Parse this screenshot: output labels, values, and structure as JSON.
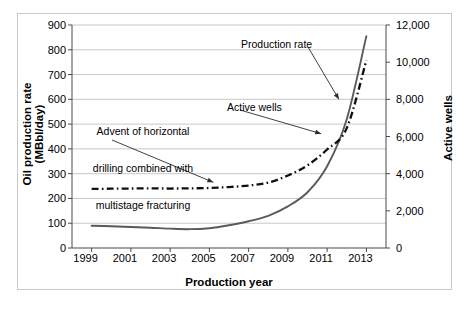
{
  "chart_data": {
    "type": "line",
    "title": "",
    "xlabel": "Production year",
    "ylabel": "Oil production rate (MBbl/day)",
    "y2label": "Active wells",
    "xlim": [
      1998,
      2014
    ],
    "ylim": [
      0,
      900
    ],
    "y2lim": [
      0,
      12000
    ],
    "grid": true,
    "legend_position": "inline-annotations",
    "xticks": [
      "1999",
      "2001",
      "2003",
      "2005",
      "2007",
      "2009",
      "2011",
      "2013"
    ],
    "xtick_values": [
      1999,
      2001,
      2003,
      2005,
      2007,
      2009,
      2011,
      2013
    ],
    "yticks": [
      "0",
      "100",
      "200",
      "300",
      "400",
      "500",
      "600",
      "700",
      "800",
      "900"
    ],
    "ytick_values": [
      0,
      100,
      200,
      300,
      400,
      500,
      600,
      700,
      800,
      900
    ],
    "y2ticks": [
      "0",
      "2,000",
      "4,000",
      "6,000",
      "8,000",
      "10,000",
      "12,000"
    ],
    "y2tick_values": [
      0,
      2000,
      4000,
      6000,
      8000,
      10000,
      12000
    ],
    "x": [
      1999,
      2000,
      2001,
      2002,
      2003,
      2004,
      2005,
      2006,
      2007,
      2008,
      2009,
      2010,
      2011,
      2012,
      2013
    ],
    "series": [
      {
        "name": "Production rate",
        "axis": "left",
        "units": "MBbl/day",
        "style": "solid",
        "color": "#5a5a5a",
        "values": [
          90,
          88,
          85,
          82,
          78,
          76,
          80,
          92,
          108,
          130,
          168,
          225,
          330,
          520,
          855
        ]
      },
      {
        "name": "Active wells",
        "axis": "right",
        "units": "wells",
        "style": "dash-dot",
        "color": "#101010",
        "values": [
          3180,
          3190,
          3200,
          3210,
          3200,
          3210,
          3230,
          3280,
          3360,
          3520,
          3900,
          4450,
          5300,
          6450,
          10100
        ]
      }
    ],
    "annotations": [
      {
        "name": "advent-annotation",
        "text": "Advent of horizontal\ndrilling combined with\nmultistage fracturing",
        "line1": "Advent of horizontal",
        "line2": "drilling combined with",
        "line3": "multistage fracturing",
        "points_to_x": 2005.2,
        "points_to_y_left": 253
      },
      {
        "name": "production-rate-label",
        "text": "Production rate",
        "points_to_x": 2011.6,
        "points_to_y_left": 600
      },
      {
        "name": "active-wells-label",
        "text": "Active wells",
        "points_to_x": 2010.9,
        "points_to_y_right": 6150
      }
    ]
  },
  "axes": {
    "xlabel": "Production year",
    "ylabel": "Oil production rate (MBbl/day)",
    "y2label": "Active wells"
  },
  "ticks": {
    "y": [
      "900",
      "800",
      "700",
      "600",
      "500",
      "400",
      "300",
      "200",
      "100",
      "0"
    ],
    "y2": [
      "12,000",
      "10,000",
      "8,000",
      "6,000",
      "4,000",
      "2,000",
      "0"
    ],
    "x": [
      "1999",
      "2001",
      "2003",
      "2005",
      "2007",
      "2009",
      "2011",
      "2013"
    ]
  },
  "labels": {
    "advent_l1": "Advent of horizontal",
    "advent_l2": "drilling combined with",
    "advent_l3": "multistage fracturing",
    "production_rate": "Production rate",
    "active_wells": "Active wells"
  },
  "colors": {
    "production_rate": "#5a5a5a",
    "active_wells": "#101010",
    "grid": "#b0b0b0",
    "axis": "#4a4a4a",
    "frame": "#c9c9c9"
  }
}
